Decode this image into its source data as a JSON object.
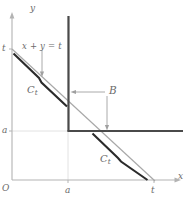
{
  "figure": {
    "background_color": "#ffffff",
    "axes": {
      "x_label": "x",
      "y_label": "y",
      "origin_label": "O",
      "axis_color": "#b3b3b3",
      "x_ticks": [
        {
          "label": "a",
          "x": 68
        },
        {
          "label": "t",
          "x": 154
        }
      ],
      "y_ticks": [
        {
          "label": "a",
          "y": 131
        },
        {
          "label": "t",
          "y": 49
        }
      ]
    },
    "labels": {
      "equation": {
        "text_x": "x",
        "text_plus": " + ",
        "text_y": "y",
        "text_eq": " = ",
        "text_t": "t",
        "full": "x + y = t"
      },
      "curve_upper": {
        "base": "C",
        "sub": "t"
      },
      "curve_lower": {
        "base": "C",
        "sub": "t"
      },
      "region": "B"
    },
    "colors": {
      "axis_gray": "#b3b3b3",
      "grid_gray": "#d8d8d8",
      "thin_line_gray": "#a8a8a8",
      "thick_curve_dark": "#2b2b2b",
      "region_boundary": "#4d4d4d",
      "leader_gray": "#a0a0a0",
      "text_gray": "#6b6b6b"
    },
    "geometry": {
      "line_xy_eq_t": {
        "from": [
          12,
          49
        ],
        "to": [
          154,
          180
        ]
      },
      "region_B_vertical": {
        "x": 68,
        "y_top": 16,
        "y_bottom": 131
      },
      "region_B_horizontal": {
        "y": 131,
        "x_left": 68,
        "x_right": 183
      },
      "curve_segment_upper": {
        "from": [
          14,
          54
        ],
        "to": [
          65,
          104
        ]
      },
      "curve_segment_lower": {
        "from": [
          93,
          134
        ],
        "to": [
          148,
          180
        ]
      }
    }
  }
}
